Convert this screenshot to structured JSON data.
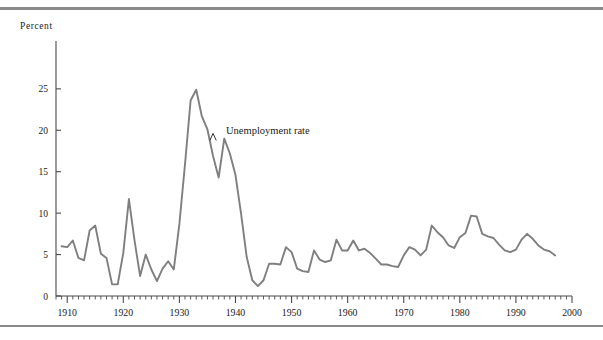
{
  "figure": {
    "percent_axis_title": "Percent",
    "series_annotation": "Unemployment rate",
    "line_color": "#7f7f7f",
    "axis_color": "#4a4a4a",
    "rule_color": "#8a8a8a",
    "background": "#ffffff"
  },
  "chart_data": {
    "type": "line",
    "title": "",
    "subtitle": "",
    "xlabel": "",
    "ylabel": "Percent",
    "grid": false,
    "legend_position": "inline-annotation",
    "annotations": [
      {
        "text": "Unemployment rate",
        "x": 1936,
        "y": 19.5
      }
    ],
    "xlim": [
      1908,
      2000
    ],
    "ylim": [
      0,
      28
    ],
    "xticks": [
      1910,
      1920,
      1930,
      1940,
      1950,
      1960,
      1970,
      1980,
      1990,
      2000
    ],
    "xtick_labels": [
      "1910",
      "1920",
      "1930",
      "1940",
      "1950",
      "1960",
      "1970",
      "1980",
      "1990",
      "2000"
    ],
    "xminor_tick_interval": 1,
    "yticks": [
      0,
      5,
      10,
      15,
      20,
      25
    ],
    "ytick_labels": [
      "0",
      "5",
      "10",
      "15",
      "20",
      "25"
    ],
    "series": [
      {
        "name": "Unemployment rate",
        "color": "#7f7f7f",
        "x": [
          1909,
          1910,
          1911,
          1912,
          1913,
          1914,
          1915,
          1916,
          1917,
          1918,
          1919,
          1920,
          1921,
          1922,
          1923,
          1924,
          1925,
          1926,
          1927,
          1928,
          1929,
          1930,
          1931,
          1932,
          1933,
          1934,
          1935,
          1936,
          1937,
          1938,
          1939,
          1940,
          1941,
          1942,
          1943,
          1944,
          1945,
          1946,
          1947,
          1948,
          1949,
          1950,
          1951,
          1952,
          1953,
          1954,
          1955,
          1956,
          1957,
          1958,
          1959,
          1960,
          1961,
          1962,
          1963,
          1964,
          1965,
          1966,
          1967,
          1968,
          1969,
          1970,
          1971,
          1972,
          1973,
          1974,
          1975,
          1976,
          1977,
          1978,
          1979,
          1980,
          1981,
          1982,
          1983,
          1984,
          1985,
          1986,
          1987,
          1988,
          1989,
          1990,
          1991,
          1992,
          1993,
          1994,
          1995,
          1996,
          1997
        ],
        "y": [
          6.0,
          5.9,
          6.7,
          4.6,
          4.3,
          7.9,
          8.5,
          5.1,
          4.6,
          1.4,
          1.4,
          5.2,
          11.7,
          6.7,
          2.4,
          5.0,
          3.2,
          1.8,
          3.3,
          4.2,
          3.2,
          8.7,
          15.9,
          23.6,
          24.9,
          21.7,
          20.1,
          16.9,
          14.3,
          19.0,
          17.2,
          14.6,
          9.9,
          4.7,
          1.9,
          1.2,
          1.9,
          3.9,
          3.9,
          3.8,
          5.9,
          5.3,
          3.3,
          3.0,
          2.9,
          5.5,
          4.4,
          4.1,
          4.3,
          6.8,
          5.5,
          5.5,
          6.7,
          5.5,
          5.7,
          5.2,
          4.5,
          3.8,
          3.8,
          3.6,
          3.5,
          4.9,
          5.9,
          5.6,
          4.9,
          5.6,
          8.5,
          7.7,
          7.1,
          6.1,
          5.8,
          7.1,
          7.6,
          9.7,
          9.6,
          7.5,
          7.2,
          7.0,
          6.2,
          5.5,
          5.3,
          5.6,
          6.8,
          7.5,
          6.9,
          6.1,
          5.6,
          5.4,
          4.9
        ]
      }
    ]
  }
}
